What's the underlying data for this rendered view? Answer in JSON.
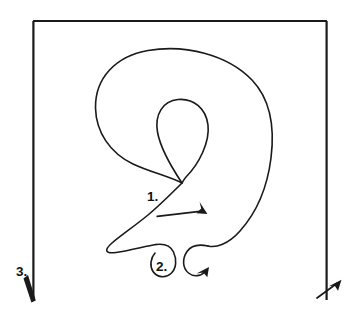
{
  "diagram": {
    "background_color": "#ffffff",
    "ink_color": "#1a1a1a",
    "width": 356,
    "height": 319,
    "steps": [
      {
        "id": "step-1",
        "label": "1.",
        "label_x": 147,
        "label_y": 201,
        "description": "diagonal arrow crossing the inner teardrop loop, pointing down-right",
        "arrow_direction": "down-right"
      },
      {
        "id": "step-2",
        "label": "2.",
        "label_x": 156,
        "label_y": 271,
        "description": "small paired curls at the bottom of the large loop, right curl ends in an arrowhead pointing up-right",
        "arrow_direction": "up-right"
      },
      {
        "id": "step-3",
        "label": "3.",
        "label_x": 16,
        "label_y": 276,
        "description": "open rectangular frame; left line ends with an arrowhead pointing down-right, right line ends with an arrowhead pointing up-right",
        "arrow_direction": "down-right"
      }
    ],
    "frame": {
      "left": 33,
      "right": 327,
      "top": 21,
      "bottom": 301,
      "open_bottom": true
    },
    "shapes": [
      {
        "name": "outer-loop",
        "type": "closed-ribbon-loop",
        "bounds": {
          "x": 95,
          "y": 49,
          "width": 178,
          "height": 215
        }
      },
      {
        "name": "inner-teardrop-loop",
        "type": "teardrop",
        "bounds": {
          "x": 157,
          "y": 99,
          "width": 52,
          "height": 85
        }
      },
      {
        "name": "bottom-left-curl",
        "type": "curl",
        "bounds": {
          "x": 150,
          "y": 243,
          "width": 32,
          "height": 35
        }
      },
      {
        "name": "bottom-right-curl",
        "type": "curl-with-arrow",
        "bounds": {
          "x": 182,
          "y": 243,
          "width": 34,
          "height": 35
        }
      }
    ]
  }
}
